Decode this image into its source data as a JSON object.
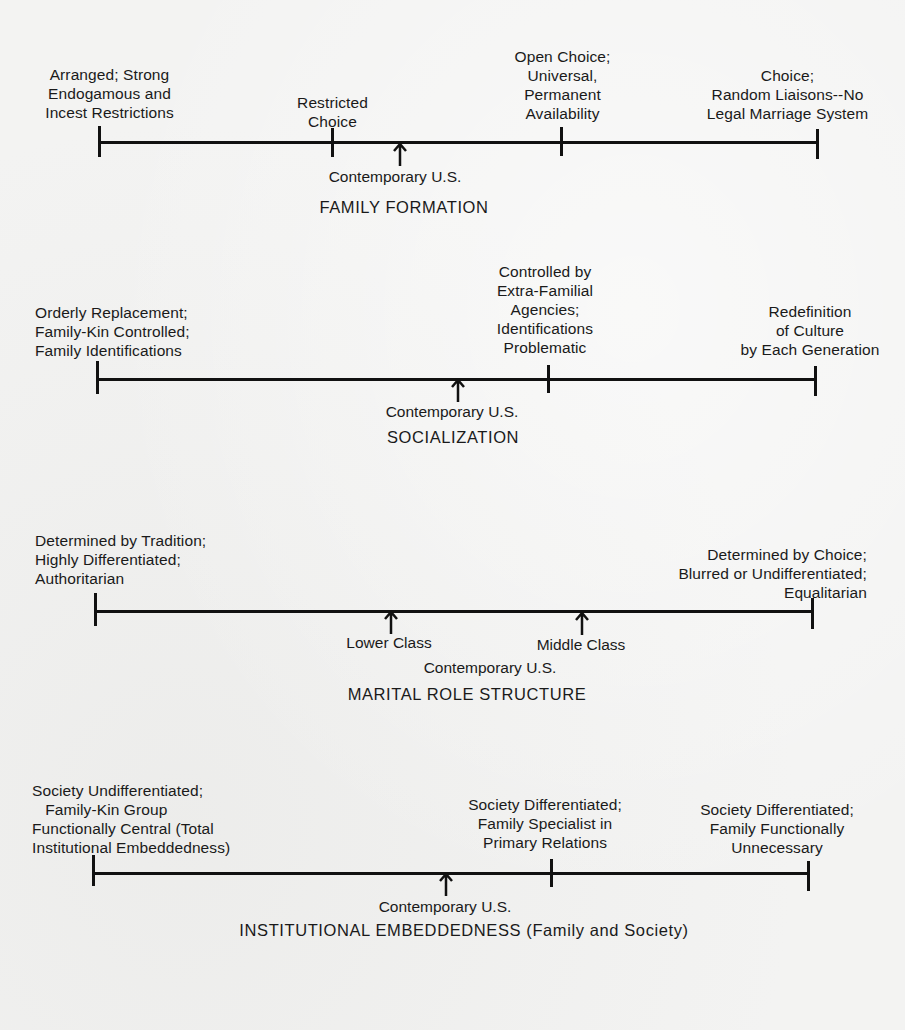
{
  "scales": [
    {
      "title": "FAMILY FORMATION",
      "contemporary_label": "Contemporary U.S.",
      "points": [
        {
          "label": "Arranged; Strong\nEndogamous and\nIncest Restrictions"
        },
        {
          "label": "Restricted\nChoice"
        },
        {
          "label": "Open Choice;\nUniversal,\nPermanent\nAvailability"
        },
        {
          "label": "Choice;\nRandom Liaisons--No\nLegal Marriage System"
        }
      ]
    },
    {
      "title": "SOCIALIZATION",
      "contemporary_label": "Contemporary U.S.",
      "points": [
        {
          "label": "Orderly Replacement;\nFamily-Kin Controlled;\nFamily Identifications"
        },
        {
          "label": "Controlled by\nExtra-Familial\nAgencies;\nIdentifications\nProblematic"
        },
        {
          "label": "Redefinition\nof Culture\nby Each Generation"
        }
      ]
    },
    {
      "title": "MARITAL ROLE STRUCTURE",
      "contemporary_label": "Contemporary U.S.",
      "markers": [
        {
          "label": "Lower Class"
        },
        {
          "label": "Middle Class"
        }
      ],
      "points": [
        {
          "label": "Determined by Tradition;\nHighly Differentiated;\nAuthoritarian"
        },
        {
          "label": "Determined by Choice;\nBlurred or Undifferentiated;\nEqualitarian"
        }
      ]
    },
    {
      "title": "INSTITUTIONAL EMBEDDEDNESS (Family and Society)",
      "contemporary_label": "Contemporary U.S.",
      "points": [
        {
          "label": "Society Undifferentiated;\n   Family-Kin Group\nFunctionally Central (Total\nInstitutional Embeddedness)"
        },
        {
          "label": "Society Differentiated;\nFamily Specialist in\nPrimary Relations"
        },
        {
          "label": "Society Differentiated;\nFamily Functionally\nUnnecessary"
        }
      ]
    }
  ],
  "colors": {
    "ink": "#111111",
    "paper": "#f3f3f2"
  }
}
